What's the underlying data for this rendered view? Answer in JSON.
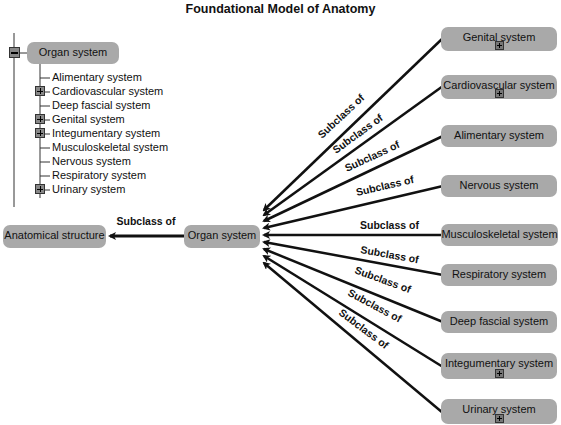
{
  "title": "Foundational Model of Anatomy",
  "tree": {
    "root": {
      "label": "Organ system",
      "expanded": true,
      "toggle_icon": "minus-icon"
    },
    "children": [
      {
        "label": "Alimentary system",
        "expandable": false
      },
      {
        "label": "Cardiovascular system",
        "expandable": true
      },
      {
        "label": "Deep fascial system",
        "expandable": false
      },
      {
        "label": "Genital system",
        "expandable": true
      },
      {
        "label": "Integumentary system",
        "expandable": true
      },
      {
        "label": "Musculoskeletal system",
        "expandable": false
      },
      {
        "label": "Nervous system",
        "expandable": false
      },
      {
        "label": "Respiratory system",
        "expandable": false
      },
      {
        "label": "Urinary system",
        "expandable": true
      }
    ]
  },
  "graph": {
    "center": {
      "label": "Organ system"
    },
    "parent": {
      "label": "Anatomical structure",
      "edge_label": "Subclass of"
    },
    "nodes": [
      {
        "label": "Genital system",
        "expandable": true,
        "edge_label": "Subclass of"
      },
      {
        "label": "Cardiovascular system",
        "expandable": true,
        "edge_label": "Subclass of"
      },
      {
        "label": "Alimentary system",
        "expandable": false,
        "edge_label": "Subclass of"
      },
      {
        "label": "Nervous system",
        "expandable": false,
        "edge_label": "Subclass of"
      },
      {
        "label": "Musculoskeletal system",
        "expandable": false,
        "edge_label": "Subclass of"
      },
      {
        "label": "Respiratory system",
        "expandable": false,
        "edge_label": "Subclass of"
      },
      {
        "label": "Deep fascial system",
        "expandable": false,
        "edge_label": "Subclass of"
      },
      {
        "label": "Integumentary system",
        "expandable": true,
        "edge_label": "Subclass of"
      },
      {
        "label": "Urinary system",
        "expandable": true,
        "edge_label": "Subclass of"
      }
    ]
  },
  "colors": {
    "node_fill": "#a9a9a9",
    "edge": "#111111",
    "background": "#ffffff"
  }
}
